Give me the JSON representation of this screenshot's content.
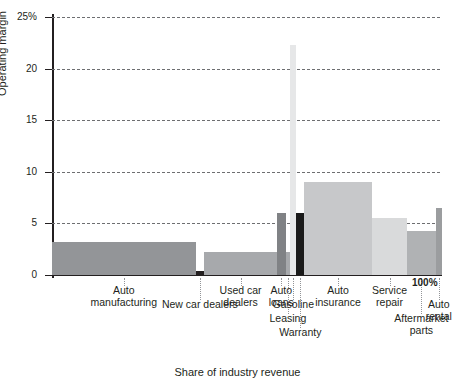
{
  "chart_data": {
    "type": "bar",
    "variant": "marimekko-variable-width",
    "title": "",
    "xlabel": "Share of industry revenue",
    "ylabel": "Operating margin",
    "ylim": [
      0,
      25
    ],
    "xlim": [
      0,
      100
    ],
    "yticks": [
      0,
      5,
      10,
      15,
      20,
      25
    ],
    "ytick_labels": [
      "0",
      "5",
      "10",
      "15",
      "20",
      "25%"
    ],
    "xtick_labels": [
      "100%"
    ],
    "grid": true,
    "legend": "none",
    "categories": [
      "Auto manufacturing",
      "New car dealers",
      "Used car dealers",
      "Auto loans",
      "Leasing",
      "Gasoline",
      "Warranty",
      "Auto insurance",
      "Service repair",
      "Aftermarket parts",
      "Auto rental"
    ],
    "values": [
      3.2,
      0.4,
      2.2,
      6.0,
      2.2,
      22.3,
      6.0,
      9.0,
      5.5,
      4.3,
      6.5
    ],
    "widths": [
      37.0,
      2.2,
      18.8,
      2.2,
      1.2,
      1.6,
      2.0,
      17.5,
      9.0,
      7.5,
      1.5
    ],
    "x_start": [
      0.0,
      37.0,
      39.2,
      58.0,
      60.2,
      61.4,
      63.0,
      65.0,
      82.5,
      91.5,
      99.0
    ],
    "bar_colors": [
      "#939598",
      "#231f20",
      "#a7a9ac",
      "#808285",
      "#a7a9ac",
      "#e6e7e8",
      "#1a1a1a",
      "#c7c8ca",
      "#d9dadb",
      "#b0b2b4",
      "#9b9d9f"
    ]
  },
  "axis": {
    "y_title": "Operating margin",
    "x_title": "Share of industry revenue",
    "y_ticks": [
      {
        "label": "25%",
        "value": 25
      },
      {
        "label": "20",
        "value": 20
      },
      {
        "label": "15",
        "value": 15
      },
      {
        "label": "10",
        "value": 10
      },
      {
        "label": "5",
        "value": 5
      },
      {
        "label": "0",
        "value": 0
      }
    ],
    "x_end_label": "100%"
  },
  "labels": [
    {
      "text": "Auto\nmanufacturing",
      "x_pct": 18.5,
      "row": 0
    },
    {
      "text": "New car dealers",
      "x_pct": 38.1,
      "row": 1
    },
    {
      "text": "Used car\ndealers",
      "x_pct": 48.6,
      "row": 0
    },
    {
      "text": "Auto\nloans",
      "x_pct": 59.1,
      "row": 0
    },
    {
      "text": "Leasing",
      "x_pct": 60.8,
      "row": 2
    },
    {
      "text": "Gasoline",
      "x_pct": 62.2,
      "row": 1
    },
    {
      "text": "Warranty",
      "x_pct": 64.0,
      "row": 3
    },
    {
      "text": "Auto\ninsurance",
      "x_pct": 73.7,
      "row": 0
    },
    {
      "text": "Service\nrepair",
      "x_pct": 87.0,
      "row": 0
    },
    {
      "text": "Aftermarket\nparts",
      "x_pct": 95.2,
      "row": 2
    },
    {
      "text": "Auto\nrental",
      "x_pct": 99.7,
      "row": 1
    }
  ]
}
